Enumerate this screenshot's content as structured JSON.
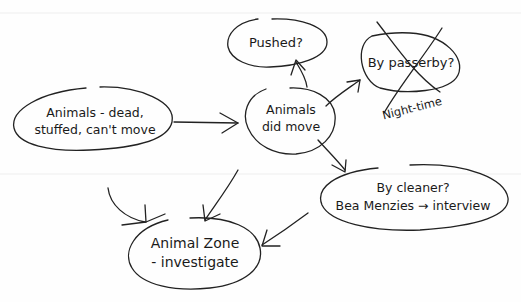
{
  "diagram": {
    "nodes": [
      {
        "id": "dead",
        "lines": [
          "Animals - dead,",
          "stuffed, can't move"
        ]
      },
      {
        "id": "pushed",
        "lines": [
          "Pushed?"
        ]
      },
      {
        "id": "moved",
        "lines": [
          "Animals",
          "did move"
        ]
      },
      {
        "id": "passerby",
        "lines": [
          "By passerby?"
        ],
        "crossed_out": true,
        "note": "Night-time"
      },
      {
        "id": "cleaner",
        "lines": [
          "By cleaner?",
          "Bea Menzies → interview"
        ]
      },
      {
        "id": "zone",
        "lines": [
          "Animal Zone",
          "- investigate"
        ]
      }
    ],
    "edges": [
      {
        "from": "dead",
        "to": "moved"
      },
      {
        "from": "moved",
        "to": "pushed"
      },
      {
        "from": "moved",
        "to": "passerby"
      },
      {
        "from": "moved",
        "to": "cleaner"
      },
      {
        "from": "dead",
        "to": "zone"
      },
      {
        "from": "moved",
        "to": "zone"
      },
      {
        "from": "cleaner",
        "to": "zone"
      }
    ]
  }
}
